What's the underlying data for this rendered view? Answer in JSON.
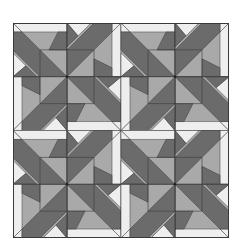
{
  "image": {
    "description": "Quilt block pattern: 2x2 repeat of pinwheel-star blocks in grays",
    "grid": {
      "rows": 2,
      "cols": 2
    },
    "block_size": 108,
    "sub_block_size": 54
  },
  "colors": {
    "background": "#ffffff",
    "light": "#eeeeee",
    "medium": "#a9a9a9",
    "dark": "#6b6b6b",
    "outline": "#3a3a3a"
  }
}
